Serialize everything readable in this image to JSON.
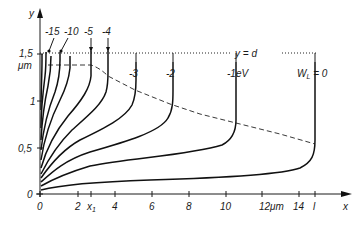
{
  "figure": {
    "y_axis_label": "y",
    "x_axis_label": "x",
    "y_ticks": [
      {
        "value": 0,
        "label": "0"
      },
      {
        "value": 0.5,
        "label": "0,5"
      },
      {
        "value": 1,
        "label": "1"
      },
      {
        "value": 1.5,
        "label": "1,5"
      }
    ],
    "y_unit": "μm",
    "x_ticks": [
      {
        "value": 0,
        "label": "0"
      },
      {
        "value": 2,
        "label": "2"
      },
      {
        "value": 2.7,
        "label": "x1",
        "label_main": "x",
        "label_sub": "1"
      },
      {
        "value": 4,
        "label": "4"
      },
      {
        "value": 6,
        "label": "6"
      },
      {
        "value": 8,
        "label": "8"
      },
      {
        "value": 10,
        "label": "10"
      },
      {
        "value": 12,
        "label": "12μm"
      },
      {
        "value": 14,
        "label": "14"
      },
      {
        "value": 14.9,
        "label": "l"
      }
    ],
    "boundary_label": "y = d",
    "boundary_y": 1.5,
    "dashed_line_label": "",
    "curves": [
      {
        "label": "-15",
        "end_x": 0.4
      },
      {
        "label": "-10",
        "end_x": 2.2
      },
      {
        "label": "-5",
        "end_x": 2.7
      },
      {
        "label": "-4",
        "end_x": 3.6
      },
      {
        "label": "-3",
        "end_x": 5.3
      },
      {
        "label": "-2",
        "end_x": 7.3
      },
      {
        "label": "-1eV",
        "end_x": 10.7
      },
      {
        "label": "WL = 0",
        "label_main": "W",
        "label_sub": "L",
        "label_tail": " = 0",
        "end_x": 14.9
      }
    ],
    "top_labels": [
      "-15",
      "-10",
      "-5",
      "-4"
    ]
  }
}
